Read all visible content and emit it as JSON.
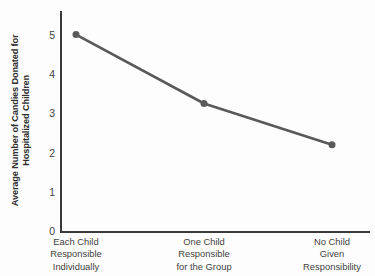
{
  "chart_data": {
    "type": "line",
    "title": "",
    "subtitle": "",
    "xlabel": "",
    "ylabel": "Average Number of Candies Donated for Hospitalized Children",
    "ylabel_lines": [
      "Average Number of Candies Donated for",
      "Hospitalized Children"
    ],
    "categories": [
      "Each Child Responsible Individually",
      "One Child Responsible for the Group",
      "No Child Given Responsibility"
    ],
    "category_lines": [
      [
        "Each Child",
        "Responsible",
        "Individually"
      ],
      [
        "One Child",
        "Responsible",
        "for the Group"
      ],
      [
        "No Child",
        "Given",
        "Responsibility"
      ]
    ],
    "values": [
      5.0,
      3.25,
      2.2
    ],
    "ylim": [
      0,
      5.6
    ],
    "yticks": [
      0,
      1,
      2,
      3,
      4,
      5
    ],
    "ytick_labels": [
      "0",
      "1",
      "2",
      "3",
      "4",
      "5"
    ],
    "xlim": [
      0,
      2
    ],
    "grid": false,
    "legend": false,
    "legend_position": "none",
    "series": [
      {
        "name": "Average candies donated",
        "values": [
          5.0,
          3.25,
          2.2
        ],
        "color": "#595959",
        "marker": "circle",
        "line_width": 2.6,
        "marker_size": 7
      }
    ],
    "annotations": []
  },
  "style": {
    "background_color": "#fdfdfd",
    "axis_color": "#3a3a3a",
    "series_color": "#595959",
    "text_color": "#3f3f3f",
    "ylabel_color": "#2e2e2e"
  }
}
